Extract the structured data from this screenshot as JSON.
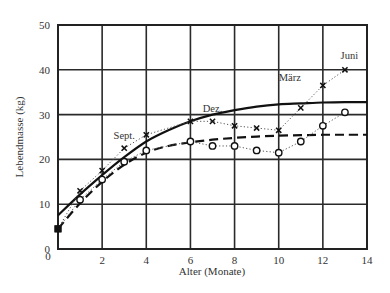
{
  "chart_data": {
    "type": "line",
    "title": "",
    "xlabel": "Alter (Monate)",
    "ylabel": "Lebendmasse (kg)",
    "xlim": [
      0,
      14
    ],
    "ylim": [
      0,
      50
    ],
    "xticks": [
      0,
      2,
      4,
      6,
      8,
      10,
      12,
      14
    ],
    "yticks": [
      0,
      10,
      20,
      30,
      40,
      50
    ],
    "xtick_labels": [
      "0",
      "2",
      "4",
      "6",
      "8",
      "10",
      "12",
      "14"
    ],
    "ytick_labels": [
      "0",
      "10",
      "20",
      "30",
      "40",
      "50"
    ],
    "grid": true,
    "legend": null,
    "annotations": [
      {
        "text": "Sept.",
        "x": 3.0,
        "y": 24.5
      },
      {
        "text": "Dez.",
        "x": 7.0,
        "y": 30.5
      },
      {
        "text": "März",
        "x": 10.5,
        "y": 37.5
      },
      {
        "text": "Juni",
        "x": 13.2,
        "y": 42.3
      }
    ],
    "series": [
      {
        "name": "Beobachtet (x)",
        "marker": "x",
        "line": "dotted",
        "x": [
          0,
          1,
          2,
          3,
          4,
          6,
          7,
          8,
          9,
          10,
          11,
          12,
          13
        ],
        "y": [
          4.5,
          13,
          17.5,
          22.5,
          25.5,
          28.5,
          28.5,
          27.5,
          27,
          26.5,
          31.5,
          36.5,
          40
        ]
      },
      {
        "name": "Beobachtet (o)",
        "marker": "o",
        "line": "dotted",
        "x": [
          0,
          1,
          2,
          3,
          4,
          6,
          7,
          8,
          9,
          10,
          11,
          12,
          13
        ],
        "y": [
          4.5,
          11,
          15.5,
          19.5,
          22,
          24,
          23,
          23,
          22,
          21.5,
          24,
          27.5,
          30.5
        ]
      },
      {
        "name": "Wachstumskurve (durchgezogen)",
        "marker": "none",
        "line": "solid",
        "x": [
          0,
          1,
          2,
          3,
          4,
          5,
          6,
          7,
          8,
          9,
          10,
          11,
          12,
          13,
          14
        ],
        "y": [
          7.5,
          12.2,
          16.5,
          20.5,
          24,
          26.5,
          28.5,
          30,
          31,
          31.8,
          32.3,
          32.5,
          32.7,
          32.8,
          32.8
        ]
      },
      {
        "name": "Wachstumskurve (gestrichelt)",
        "marker": "none",
        "line": "dashed",
        "x": [
          0,
          1,
          2,
          3,
          4,
          5,
          6,
          7,
          8,
          9,
          10,
          11,
          12,
          13,
          14
        ],
        "y": [
          4.5,
          10.2,
          15,
          18.8,
          21.5,
          23,
          23.8,
          24.4,
          24.8,
          25.1,
          25.3,
          25.4,
          25.5,
          25.5,
          25.5
        ]
      }
    ]
  }
}
